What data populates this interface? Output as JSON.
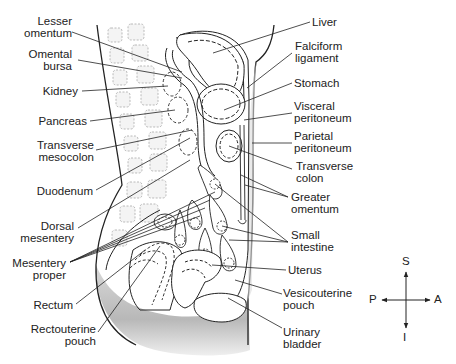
{
  "figure": {
    "labels_left": [
      {
        "id": "lesser-omentum",
        "text": "Lesser\nomentum"
      },
      {
        "id": "omental-bursa",
        "text": "Omental\nbursa"
      },
      {
        "id": "kidney",
        "text": "Kidney"
      },
      {
        "id": "pancreas",
        "text": "Pancreas"
      },
      {
        "id": "transverse-mesocolon",
        "text": "Transverse\nmesocolon"
      },
      {
        "id": "duodenum",
        "text": "Duodenum"
      },
      {
        "id": "dorsal-mesentery",
        "text": "Dorsal\nmesentery"
      },
      {
        "id": "mesentery-proper",
        "text": "Mesentery\nproper"
      },
      {
        "id": "rectum",
        "text": "Rectum"
      },
      {
        "id": "rectouterine-pouch",
        "text": "Rectouterine\npouch"
      }
    ],
    "labels_right": [
      {
        "id": "liver",
        "text": "Liver"
      },
      {
        "id": "falciform-ligament",
        "text": "Falciform\nligament"
      },
      {
        "id": "stomach",
        "text": "Stomach"
      },
      {
        "id": "visceral-peritoneum",
        "text": "Visceral\nperitoneum"
      },
      {
        "id": "parietal-peritoneum",
        "text": "Parietal\nperitoneum"
      },
      {
        "id": "transverse-colon",
        "text": "Transverse\ncolon"
      },
      {
        "id": "greater-omentum",
        "text": "Greater\nomentum"
      },
      {
        "id": "small-intestine",
        "text": "Small\nintestine"
      },
      {
        "id": "uterus",
        "text": "Uterus"
      },
      {
        "id": "vesicouterine-pouch",
        "text": "Vesicouterine\npouch"
      },
      {
        "id": "urinary-bladder",
        "text": "Urinary\nbladder"
      }
    ],
    "compass": {
      "superior": "S",
      "inferior": "I",
      "posterior": "P",
      "anterior": "A"
    },
    "colors": {
      "line": "#222222",
      "pelvis_shade": "#c8c8c8",
      "vertebra_dots": "#9a9a9a",
      "background": "#ffffff"
    }
  }
}
